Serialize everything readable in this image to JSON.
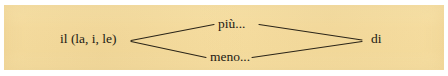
{
  "figure": {
    "type": "grammar-pattern-diagram",
    "language": "Italian",
    "panel_color": "#f7dfa2",
    "line_color": "#2a2418",
    "text_color": "#1d1a14",
    "nodes": {
      "left": "il (la, i, le)",
      "top": "più...",
      "bottom": "meno...",
      "right": "di"
    },
    "connections": [
      {
        "from": "il (la, i, le)",
        "to": "più..."
      },
      {
        "from": "più...",
        "to": "di"
      },
      {
        "from": "il (la, i, le)",
        "to": "meno..."
      },
      {
        "from": "meno...",
        "to": "di"
      }
    ]
  }
}
